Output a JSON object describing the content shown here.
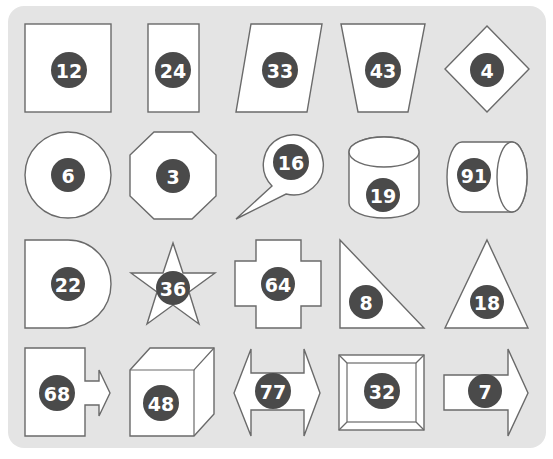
{
  "panel": {
    "background": "#e4e4e4",
    "badge_color": "#4a4a4a",
    "stroke_color": "#6a6a6a"
  },
  "shapes": [
    {
      "shape": "square",
      "number": "12"
    },
    {
      "shape": "tall-rectangle",
      "number": "24"
    },
    {
      "shape": "parallelogram",
      "number": "33"
    },
    {
      "shape": "trapezoid",
      "number": "43"
    },
    {
      "shape": "diamond",
      "number": "4"
    },
    {
      "shape": "circle",
      "number": "6"
    },
    {
      "shape": "octagon",
      "number": "3"
    },
    {
      "shape": "speech-bubble",
      "number": "16"
    },
    {
      "shape": "vertical-cylinder",
      "number": "19"
    },
    {
      "shape": "horizontal-cylinder",
      "number": "91"
    },
    {
      "shape": "d-shape",
      "number": "22"
    },
    {
      "shape": "star",
      "number": "36"
    },
    {
      "shape": "cross",
      "number": "64"
    },
    {
      "shape": "right-triangle",
      "number": "8"
    },
    {
      "shape": "triangle",
      "number": "18"
    },
    {
      "shape": "square-with-arrow",
      "number": "68"
    },
    {
      "shape": "cube",
      "number": "48"
    },
    {
      "shape": "double-arrow",
      "number": "77"
    },
    {
      "shape": "beveled-frame",
      "number": "32"
    },
    {
      "shape": "right-arrow",
      "number": "7"
    }
  ]
}
